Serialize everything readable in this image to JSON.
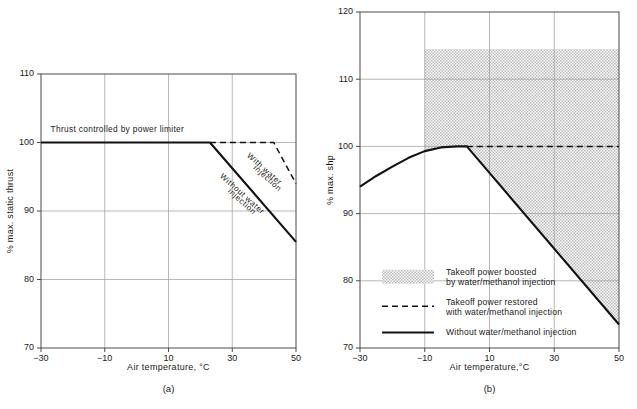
{
  "figure": {
    "background": "#ffffff",
    "ink": "#111111",
    "grid_color": "#9a9a9a",
    "shade_color": "#b9b9b9"
  },
  "chart_data": [
    {
      "id": "panel-a",
      "type": "line",
      "title": "",
      "caption": "(a)",
      "xlabel": "Air temperature, °C",
      "ylabel": "% max. static thrust",
      "xlim": [
        -30,
        50
      ],
      "ylim": [
        70,
        110
      ],
      "xticks": [
        -30,
        -10,
        10,
        30,
        50
      ],
      "xticklabels": [
        "−30",
        "−10",
        "10",
        "30",
        "50"
      ],
      "yticks": [
        70,
        80,
        90,
        100,
        110
      ],
      "yticklabels": [
        "70",
        "80",
        "90",
        "100",
        "110"
      ],
      "grid": true,
      "legend": "none",
      "annotations": [
        {
          "name": "power-limiter-note",
          "text": "Thrust controlled by power limiter",
          "x": -27,
          "y": 101.6,
          "rotation": 0
        },
        {
          "name": "with-water-injection-label",
          "text": "With water",
          "x": 34.5,
          "y": 98.0,
          "rotation": 42
        },
        {
          "name": "with-water-injection-label-2",
          "text": "injection",
          "x": 36.5,
          "y": 96.2,
          "rotation": 42
        },
        {
          "name": "without-water-injection-label",
          "text": "Without water",
          "x": 26.0,
          "y": 95.0,
          "rotation": 42
        },
        {
          "name": "without-water-injection-label-2",
          "text": "injection",
          "x": 28.5,
          "y": 92.8,
          "rotation": 42
        }
      ],
      "series": [
        {
          "name": "Thrust controlled by power limiter / Without water injection",
          "style": "solid",
          "x": [
            -30,
            23,
            50
          ],
          "values": [
            100,
            100,
            85.5
          ]
        },
        {
          "name": "With water injection",
          "style": "dashed",
          "x": [
            23,
            43,
            50
          ],
          "values": [
            100,
            100,
            94.0
          ]
        }
      ]
    },
    {
      "id": "panel-b",
      "type": "line",
      "title": "",
      "caption": "(b)",
      "xlabel": "Air temperature,°C",
      "ylabel": "% max. shp",
      "xlim": [
        -30,
        50
      ],
      "ylim": [
        70,
        120
      ],
      "xticks": [
        -30,
        -10,
        10,
        30,
        50
      ],
      "xticklabels": [
        "−30",
        "−10",
        "10",
        "30",
        "50"
      ],
      "yticks": [
        70,
        80,
        90,
        100,
        110,
        120
      ],
      "yticklabels": [
        "70",
        "80",
        "90",
        "100",
        "110",
        "120"
      ],
      "grid": true,
      "legend": "inside-lower-left",
      "shaded_region": {
        "name": "takeoff-power-boost-region",
        "x_start": -10,
        "x_end": 50,
        "y_top": 114.5,
        "label": "Takeoff power boosted by water/methanol injection"
      },
      "series": [
        {
          "name": "Without water/methanol injection",
          "style": "solid",
          "x": [
            -30,
            -25,
            -20,
            -15,
            -10,
            -5,
            0,
            3,
            50
          ],
          "values": [
            94.0,
            95.6,
            97.0,
            98.3,
            99.3,
            99.85,
            100.0,
            100.0,
            73.5
          ]
        },
        {
          "name": "Takeoff power restored with water/methanol injection",
          "style": "dashed",
          "x": [
            3,
            50
          ],
          "values": [
            100,
            100
          ]
        }
      ],
      "legend_entries": [
        {
          "name": "legend-boosted",
          "swatch": "shaded",
          "line1": "Takeoff power boosted",
          "line2": "by water/methanol injection"
        },
        {
          "name": "legend-restored",
          "swatch": "dashed",
          "line1": "Takeoff power restored",
          "line2": "with water/methanol injection"
        },
        {
          "name": "legend-without",
          "swatch": "solid",
          "line1": "Without water/methanol injection",
          "line2": ""
        }
      ]
    }
  ]
}
